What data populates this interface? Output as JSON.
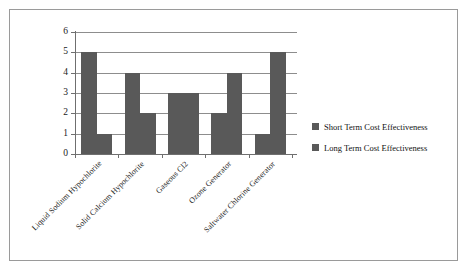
{
  "chart_data": {
    "type": "bar",
    "title": "",
    "subtitle": "",
    "xlabel": "",
    "ylabel": "",
    "ylim": [
      0,
      6
    ],
    "ytick_labels": [
      "6",
      "5",
      "4",
      "3",
      "2",
      "1",
      "0"
    ],
    "ytick_values": [
      6,
      5,
      4,
      3,
      2,
      1,
      0
    ],
    "grid": true,
    "legend_position": "right",
    "orientation": "vertical",
    "grouping": "grouped",
    "categories": [
      "Liquid Sodium Hypochlorite",
      "Solid Calcium Hypochlorite",
      "Gaseous Cl2",
      "Ozone Generator",
      "Saltwater Chlorine Generator"
    ],
    "series": [
      {
        "name": "Short Term Cost Effectiveness",
        "color": "#595959",
        "values": [
          5,
          4,
          3,
          2,
          1
        ]
      },
      {
        "name": "Long Term Cost Effectiveness",
        "color": "#595959",
        "values": [
          1,
          2,
          3,
          4,
          5
        ]
      }
    ]
  },
  "legend": {
    "items": [
      {
        "label": "Short Term Cost Effectiveness",
        "color": "#595959"
      },
      {
        "label": "Long Term Cost Effectiveness",
        "color": "#595959"
      }
    ]
  },
  "colors": {
    "bar": "#595959",
    "gridline": "#8d8d8d",
    "axis": "#6f6f6f",
    "frame": "#9a9a9a",
    "background": "#ffffff",
    "text": "#1a1a1a"
  }
}
